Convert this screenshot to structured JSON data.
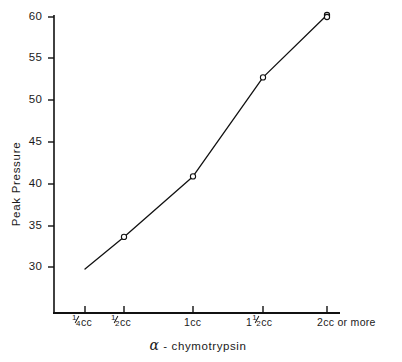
{
  "chart_data": {
    "type": "line",
    "title": "",
    "subtitle": "",
    "xlabel": "α - chymotrypsin",
    "ylabel": "Peak Pressure",
    "categories": [
      "1/4 cc",
      "1/2 cc",
      "1 cc",
      "1 1/2 cc",
      "2 cc or more"
    ],
    "x_tick_labels": [
      {
        "whole": "",
        "num": "1",
        "den": "4",
        "unit": "cc"
      },
      {
        "whole": "",
        "num": "1",
        "den": "2",
        "unit": "cc"
      },
      {
        "whole": "1",
        "num": "",
        "den": "",
        "unit": "cc"
      },
      {
        "whole": "1",
        "num": "1",
        "den": "2",
        "unit": "cc"
      },
      {
        "whole": "2",
        "num": "",
        "den": "",
        "unit": "cc  or  more"
      }
    ],
    "values": [
      32.3,
      35.8,
      42.4,
      53.2,
      60.0
    ],
    "series": [
      {
        "name": "Peak Pressure",
        "values": [
          32.3,
          35.8,
          42.4,
          53.2,
          60.0
        ]
      }
    ],
    "y_ticks": [
      30,
      35,
      40,
      45,
      50,
      55,
      60
    ],
    "y_tick_labels": [
      "30",
      "35",
      "40",
      "45",
      "50",
      "55",
      "60"
    ],
    "ylim": [
      27.5,
      60
    ],
    "xlim": [
      0,
      5
    ],
    "grid": false,
    "legend": false,
    "legend_position": "none",
    "marker": "open-circle",
    "line_color": "#1a1a1a",
    "marker_color": "#1a1a1a",
    "background_color": "#ffffff",
    "axis_color": "#000000"
  },
  "axis_titles": {
    "y": "Peak Pressure",
    "x_alpha": "α",
    "x_rest": "- chymotrypsin"
  }
}
